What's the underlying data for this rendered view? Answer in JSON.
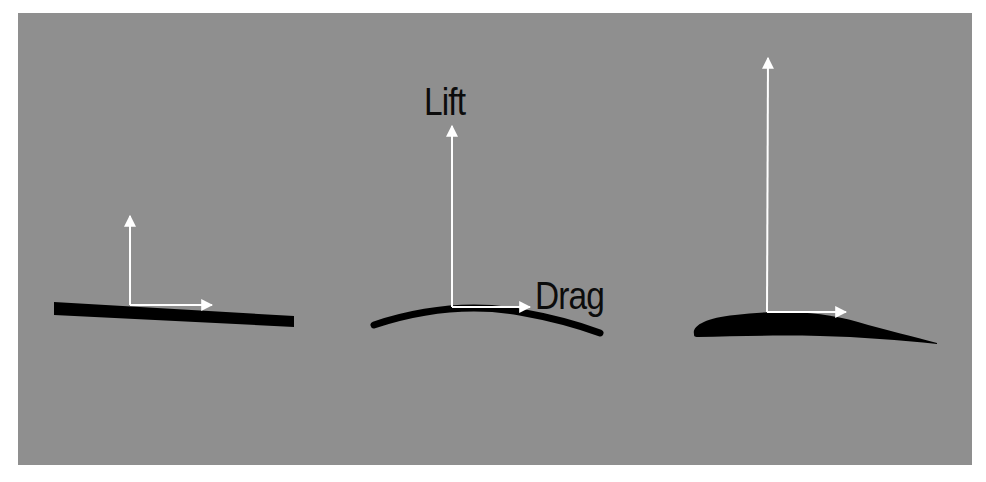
{
  "diagram": {
    "title": "",
    "background_color": "#8f8f8f",
    "arrow_color": "#ffffff",
    "airfoil_color": "#000000",
    "labels": {
      "lift": "Lift",
      "drag": "Drag"
    },
    "panels": [
      {
        "id": "flat-plate",
        "shape": "flat plate",
        "lift_arrow_relative_length": 1,
        "drag_arrow_relative_length": 1
      },
      {
        "id": "cambered-plate",
        "shape": "thin cambered plate",
        "lift_arrow_relative_length": 2,
        "drag_arrow_relative_length": 1
      },
      {
        "id": "airfoil",
        "shape": "thick cambered airfoil",
        "lift_arrow_relative_length": 2.8,
        "drag_arrow_relative_length": 1
      }
    ]
  }
}
